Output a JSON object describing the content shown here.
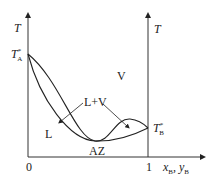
{
  "diagram": {
    "type": "phase-diagram-minimum-azeotrope",
    "left_axis_label": "T",
    "right_axis_label": "T",
    "x_axis_label": "x_B, y_B",
    "x_axis_label_main": "x",
    "x_axis_label_sub1": "B",
    "x_axis_label_sep": ", y",
    "x_axis_label_sub2": "B",
    "tick_zero": "0",
    "tick_one": "1",
    "point_A": {
      "main": "T",
      "sup": "*",
      "sub": "A"
    },
    "point_B": {
      "main": "T",
      "sup": "*",
      "sub": "B"
    },
    "region_vapor": "V",
    "region_liquid": "L",
    "region_two_phase": "L+V",
    "azeotrope_label": "AZ",
    "colors": {
      "line": "#222222",
      "axis": "#333333",
      "background": "#ffffff"
    }
  }
}
